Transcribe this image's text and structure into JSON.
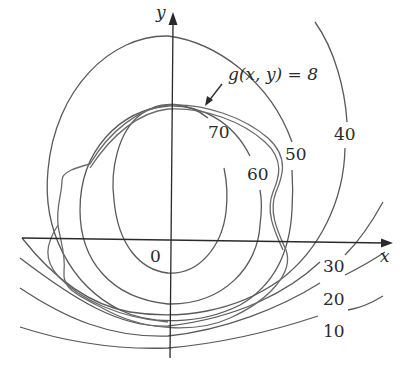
{
  "figure": {
    "type": "contour-diagram",
    "axes": {
      "x_label": "x",
      "y_label": "y",
      "origin_label": "0"
    },
    "constraint": {
      "label": "g(x, y) = 8"
    },
    "level_curves": [
      {
        "value": "70",
        "label": "70"
      },
      {
        "value": "60",
        "label": "60"
      },
      {
        "value": "50",
        "label": "50"
      },
      {
        "value": "40",
        "label": "40"
      },
      {
        "value": "30",
        "label": "30"
      },
      {
        "value": "20",
        "label": "20"
      },
      {
        "value": "10",
        "label": "10"
      }
    ],
    "colors": {
      "curves": "#5a5a5a",
      "axes": "#2a2a2a",
      "background": "#ffffff"
    }
  }
}
